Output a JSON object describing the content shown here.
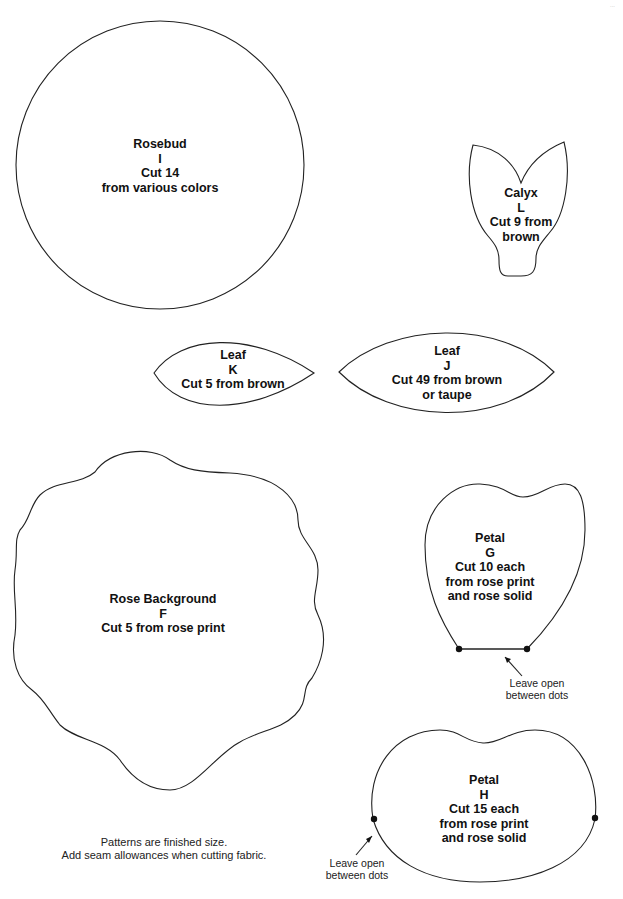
{
  "page": {
    "page_mark": "..."
  },
  "pieces": {
    "rosebud": {
      "name": "Rosebud",
      "letter": "I",
      "cut": "Cut 14",
      "fabric": "from various colors"
    },
    "calyx": {
      "name": "Calyx",
      "letter": "L",
      "cut": "Cut 9 from",
      "fabric": "brown"
    },
    "leaf_k": {
      "name": "Leaf",
      "letter": "K",
      "cut": "Cut 5 from brown"
    },
    "leaf_j": {
      "name": "Leaf",
      "letter": "J",
      "cut": "Cut 49 from brown",
      "fabric": "or taupe"
    },
    "rose_background": {
      "name": "Rose Background",
      "letter": "F",
      "cut": "Cut 5 from rose print"
    },
    "petal_g": {
      "name": "Petal",
      "letter": "G",
      "cut": "Cut 10 each",
      "fabric1": "from rose print",
      "fabric2": "and rose solid",
      "note1": "Leave open",
      "note2": "between dots"
    },
    "petal_h": {
      "name": "Petal",
      "letter": "H",
      "cut": "Cut 15 each",
      "fabric1": "from rose print",
      "fabric2": "and rose solid",
      "note1": "Leave open",
      "note2": "between dots"
    }
  },
  "footer": {
    "line1": "Patterns are finished size.",
    "line2": "Add seam allowances when cutting fabric."
  }
}
